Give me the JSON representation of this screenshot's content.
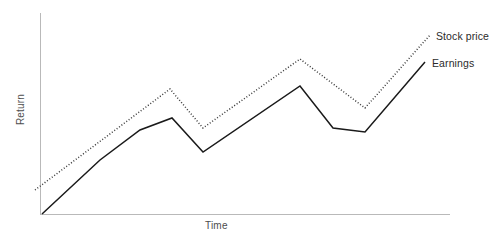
{
  "chart_data": {
    "type": "line",
    "title": "",
    "xlabel": "Time",
    "ylabel": "Return",
    "grid": false,
    "legend_position": "right-inline",
    "axis_ranges": {
      "x": [
        0,
        100
      ],
      "y": [
        0,
        100
      ]
    },
    "tick_labels": {
      "x": [],
      "y": []
    },
    "series": [
      {
        "name": "Stock price",
        "style": "dotted",
        "color": "#3a3a3a",
        "x": [
          0,
          32,
          40,
          65,
          74,
          83,
          95
        ],
        "y": [
          15,
          62,
          52,
          80,
          58,
          70,
          92
        ],
        "points_px": [
          [
            35,
            190
          ],
          [
            170,
            89
          ],
          [
            203,
            128
          ],
          [
            300,
            59
          ],
          [
            365,
            108
          ],
          [
            430,
            35
          ]
        ]
      },
      {
        "name": "Earnings",
        "style": "solid",
        "color": "#1a1a1a",
        "x": [
          0,
          32,
          40,
          65,
          72,
          80,
          94
        ],
        "y": [
          0,
          47,
          31,
          65,
          40,
          38,
          77
        ],
        "points_px": [
          [
            42,
            214
          ],
          [
            100,
            160
          ],
          [
            140,
            130
          ],
          [
            172,
            118
          ],
          [
            203,
            152
          ],
          [
            300,
            86
          ],
          [
            333,
            128
          ],
          [
            365,
            132
          ],
          [
            425,
            62
          ]
        ]
      }
    ]
  },
  "axes": {
    "y_title": "Return",
    "x_title": "Time",
    "axis_color": "#b9b9b9"
  },
  "legend": {
    "items": [
      {
        "label": "Stock price",
        "style": "dotted"
      },
      {
        "label": "Earnings",
        "style": "solid"
      }
    ],
    "stock_price_label": "Stock price",
    "earnings_label": "Earnings"
  }
}
